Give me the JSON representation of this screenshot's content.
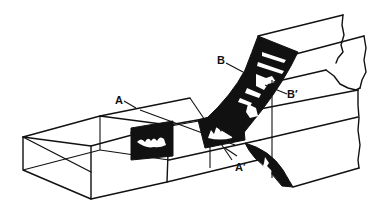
{
  "figure": {
    "type": "block diagram",
    "colors": {
      "ink": "#111111",
      "background": "#ffffff"
    }
  },
  "labels": {
    "a": "A",
    "a_prime": "A′",
    "b": "B",
    "b_prime": "B′"
  },
  "sections": [
    {
      "id": "A-A'",
      "from": "A",
      "to": "A′"
    },
    {
      "id": "B-B'",
      "from": "B",
      "to": "B′"
    }
  ]
}
